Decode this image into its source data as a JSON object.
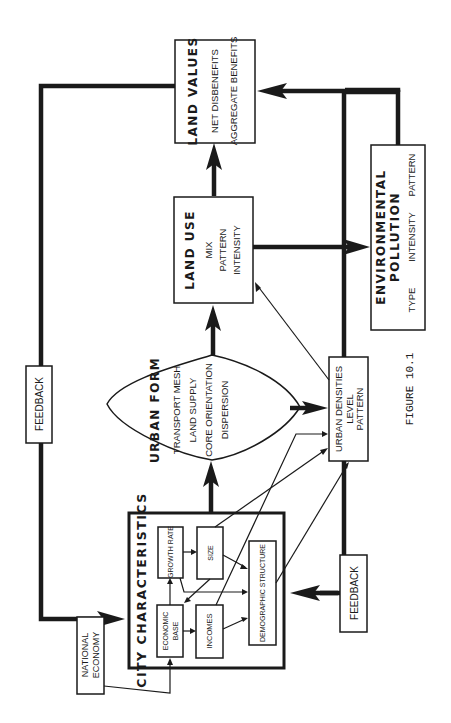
{
  "figure": {
    "caption": "FIGURE 10.1",
    "orientation": "rotated 90deg counterclockwise"
  },
  "nodes": {
    "national_economy": {
      "line1": "NATIONAL",
      "line2": "ECONOMY"
    },
    "city_characteristics": {
      "title": "CITY CHARACTERISTICS",
      "economic_base": {
        "line1": "ECONOMIC",
        "line2": "BASE"
      },
      "growth_rate": "GROWTH RATE",
      "size": "SIZE",
      "incomes": "INCOMES",
      "demographic_structure": "DEMOGRAPHIC STRUCTURE"
    },
    "urban_form": {
      "title": "URBAN FORM",
      "items": [
        "TRANSPORT MESH",
        "LAND SUPPLY",
        "CORE ORIENTATION",
        "DISPERSION"
      ]
    },
    "urban_densities": {
      "items": [
        "URBAN DENSITIES",
        "LEVEL",
        "PATTERN"
      ]
    },
    "land_use": {
      "title": "LAND USE",
      "items": [
        "MIX",
        "PATTERN",
        "INTENSITY"
      ]
    },
    "land_values": {
      "title": "LAND VALUES",
      "items": [
        "NET DISBENEFITS",
        "AGGREGATE BENEFITS"
      ]
    },
    "environmental_pollution": {
      "title_line1": "ENVIRONMENTAL",
      "title_line2": "POLLUTION",
      "items": [
        "TYPE",
        "INTENSITY",
        "PATTERN"
      ]
    },
    "feedback_top": "FEEDBACK",
    "feedback_bottom": "FEEDBACK"
  }
}
